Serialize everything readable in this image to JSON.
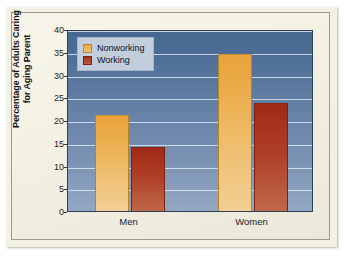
{
  "chart_data": {
    "type": "bar",
    "title": "",
    "xlabel": "",
    "ylabel": "Percentage of Adults Caring for Aging Parent",
    "ylabel_line1": "Percentage of Adults Caring",
    "ylabel_line2": "for Aging Parent",
    "categories": [
      "Men",
      "Women"
    ],
    "series": [
      {
        "name": "Nonworking",
        "color": "#eba63f",
        "values": [
          21.0,
          34.5
        ]
      },
      {
        "name": "Working",
        "color": "#a8331d",
        "values": [
          14.0,
          23.7
        ]
      }
    ],
    "ylim": [
      0,
      40
    ],
    "ytick_values": [
      0,
      5,
      10,
      15,
      20,
      25,
      30,
      35,
      40
    ],
    "ytick_labels": [
      "0",
      "5",
      "10",
      "15",
      "20",
      "25",
      "30",
      "35",
      "40"
    ],
    "grid": true,
    "grid_axis": "y",
    "legend_position": "upper left"
  },
  "style": {
    "page_background": "#f6f3e8",
    "plot_background_top": "#46678f",
    "plot_background_bottom": "#93a7c2",
    "gridline_color": "#e6eef8",
    "legend_background": "#c3cedd",
    "axis_text_color": "#1d1d1d"
  }
}
